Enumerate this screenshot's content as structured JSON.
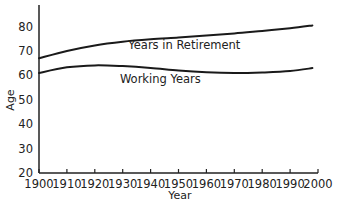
{
  "chart_data": {
    "type": "line",
    "title": "",
    "xlabel": "Year",
    "ylabel": "Age",
    "xlim": [
      1900,
      2000
    ],
    "ylim": [
      20,
      88
    ],
    "grid": false,
    "legend": "inline labels",
    "x_ticks": [
      "1900",
      "1910",
      "1920",
      "1930",
      "1940",
      "1950",
      "1960",
      "1970",
      "1980",
      "1990",
      "2000"
    ],
    "y_ticks": [
      "20",
      "30",
      "40",
      "50",
      "60",
      "70",
      "80"
    ],
    "x": [
      1900,
      1910,
      1920,
      1930,
      1940,
      1950,
      1960,
      1970,
      1980,
      1990,
      1998
    ],
    "series": [
      {
        "name": "Years in Retirement",
        "values": [
          67,
          70,
          72.3,
          73.8,
          74.8,
          75.5,
          76.3,
          77.2,
          78.2,
          79.3,
          80.5
        ],
        "label_position": {
          "year": 1932,
          "age": 71
        }
      },
      {
        "name": "Working Years",
        "values": [
          61,
          63.3,
          64.1,
          63.8,
          63,
          62,
          61.3,
          61,
          61.2,
          61.8,
          63
        ],
        "label_position": {
          "year": 1929,
          "age": 57
        }
      }
    ]
  }
}
